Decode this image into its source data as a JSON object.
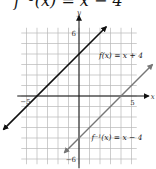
{
  "title": "f⁻¹(x) = x − 4",
  "chart_data": {
    "type": "line",
    "title": "f⁻¹(x) = x − 4",
    "xlabel": "x",
    "ylabel": "y",
    "xlim": [
      -5,
      5
    ],
    "ylim": [
      -6,
      6
    ],
    "grid": true,
    "tick_labels": {
      "x_neg": "−5",
      "x_pos": "5",
      "y_pos": "6",
      "y_neg": "−6"
    },
    "series": [
      {
        "name": "f(x) = x + 4",
        "label": "f(x) = x + 4",
        "slope": 1,
        "intercept": 4,
        "x": [
          -6,
          6
        ],
        "y": [
          -2,
          10
        ],
        "color": "#111111"
      },
      {
        "name": "f⁻¹(x) = x − 4",
        "label": "f⁻¹(x) = x − 4",
        "slope": 1,
        "intercept": -4,
        "x": [
          -2,
          7
        ],
        "y": [
          -6.8,
          3
        ],
        "color": "#777777"
      }
    ]
  }
}
